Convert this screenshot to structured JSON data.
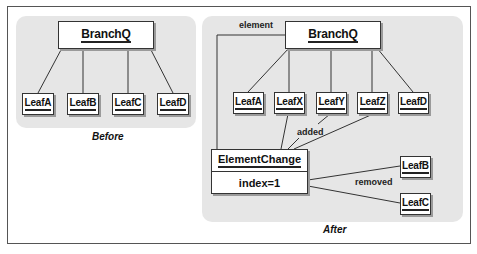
{
  "diagram": {
    "before": {
      "caption": "Before",
      "root": "BranchQ",
      "children": [
        "LeafA",
        "LeafB",
        "LeafC",
        "LeafD"
      ]
    },
    "after": {
      "caption": "After",
      "root": "BranchQ",
      "children": [
        "LeafA",
        "LeafX",
        "LeafY",
        "LeafZ",
        "LeafD"
      ],
      "change": {
        "title": "ElementChange",
        "field": "index=1"
      },
      "removed": [
        "LeafB",
        "LeafC"
      ],
      "labels": {
        "element": "element",
        "added": "added",
        "removed": "removed"
      }
    }
  },
  "colors": {
    "panel": "#e6e6e6",
    "border": "#333333",
    "shadow": "#9a9a9a"
  }
}
